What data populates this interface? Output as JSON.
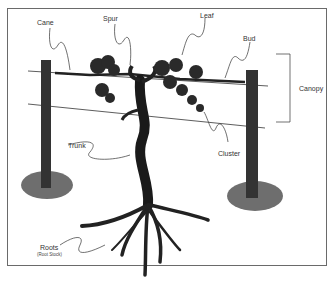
{
  "diagram": {
    "labels": {
      "cane": "Cane",
      "spur": "Spur",
      "leaf": "Leaf",
      "bud": "Bud",
      "canopy": "Canopy",
      "trunk": "Trunk",
      "cluster": "Cluster",
      "roots": "Roots",
      "roots_sub": "(Root Stock)"
    },
    "colors": {
      "ink": "#222222",
      "post": "#3a3a3a",
      "ground": "#555555",
      "frame": "#6a6a6a"
    }
  }
}
